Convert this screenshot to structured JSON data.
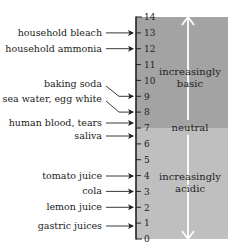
{
  "diagram": {
    "scale": {
      "min": 0,
      "max": 14,
      "ticks": [
        "0",
        "1",
        "2",
        "3",
        "4",
        "5",
        "6",
        "7",
        "8",
        "9",
        "10",
        "11",
        "12",
        "13",
        "14"
      ]
    },
    "regions": {
      "basic": {
        "label_line1": "increasingly",
        "label_line2": "basic",
        "range": [
          7,
          14
        ],
        "color": "#a3a3a3"
      },
      "neutral": {
        "label": "neutral",
        "value": 7
      },
      "acidic": {
        "label_line1": "increasingly",
        "label_line2": "acidic",
        "range": [
          0,
          7
        ],
        "color": "#bfbfbf"
      }
    },
    "arrow_color": "#ffffff",
    "substances": [
      {
        "name": "household bleach",
        "ph": 13
      },
      {
        "name": "household ammonia",
        "ph": 12
      },
      {
        "name": "baking soda",
        "ph": 9
      },
      {
        "name": "sea water, egg white",
        "ph": 8
      },
      {
        "name": "human blood, tears",
        "ph": 7
      },
      {
        "name": "saliva",
        "ph": 6
      },
      {
        "name": "tomato juice",
        "ph": 4
      },
      {
        "name": "cola",
        "ph": 3
      },
      {
        "name": "lemon juice",
        "ph": 2
      },
      {
        "name": "gastric juices",
        "ph": 1
      }
    ]
  }
}
